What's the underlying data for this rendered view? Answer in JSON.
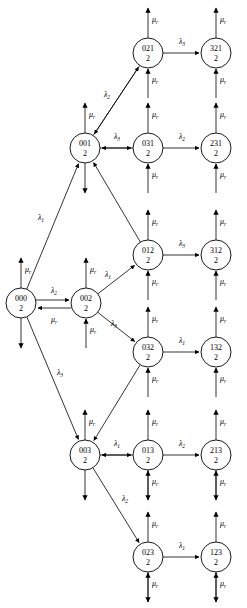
{
  "diagram": {
    "type": "markov-state-transition-graph",
    "node_radius": 15,
    "state_second_line": "2",
    "nodes": [
      {
        "id": "021",
        "label": "021",
        "sub": "2",
        "x": 148,
        "y": 53
      },
      {
        "id": "321",
        "label": "321",
        "sub": "2",
        "x": 216,
        "y": 53
      },
      {
        "id": "001",
        "label": "001",
        "sub": "2",
        "x": 85,
        "y": 148
      },
      {
        "id": "031",
        "label": "031",
        "sub": "2",
        "x": 148,
        "y": 148
      },
      {
        "id": "231",
        "label": "231",
        "sub": "2",
        "x": 216,
        "y": 148
      },
      {
        "id": "012",
        "label": "012",
        "sub": "2",
        "x": 148,
        "y": 255
      },
      {
        "id": "312",
        "label": "312",
        "sub": "2",
        "x": 216,
        "y": 255
      },
      {
        "id": "000",
        "label": "000",
        "sub": "2",
        "x": 21,
        "y": 303
      },
      {
        "id": "002",
        "label": "002",
        "sub": "2",
        "x": 86,
        "y": 303
      },
      {
        "id": "032",
        "label": "032",
        "sub": "2",
        "x": 148,
        "y": 352
      },
      {
        "id": "132",
        "label": "132",
        "sub": "2",
        "x": 216,
        "y": 352
      },
      {
        "id": "003",
        "label": "003",
        "sub": "2",
        "x": 85,
        "y": 455
      },
      {
        "id": "013",
        "label": "013",
        "sub": "2",
        "x": 148,
        "y": 455
      },
      {
        "id": "213",
        "label": "213",
        "sub": "2",
        "x": 216,
        "y": 455
      },
      {
        "id": "023",
        "label": "023",
        "sub": "2",
        "x": 148,
        "y": 557
      },
      {
        "id": "123",
        "label": "123",
        "sub": "2",
        "x": 216,
        "y": 557
      }
    ],
    "transition_rates": {
      "lambda1": {
        "base": "λ",
        "sub": "1"
      },
      "lambda2": {
        "base": "λ",
        "sub": "2"
      },
      "lambda3": {
        "base": "λ",
        "sub": "3"
      },
      "mu_r": {
        "base": "μ",
        "sub": "r"
      }
    },
    "horizontal_edges": [
      {
        "from": "021",
        "to": "321",
        "rate_base": "λ",
        "rate_sub": "3",
        "label_x": 182,
        "label_y": 44
      },
      {
        "from": "001",
        "to": "031",
        "rate_base": "λ",
        "rate_sub": "3",
        "label_x": 117,
        "label_y": 139
      },
      {
        "from": "031",
        "to": "231",
        "rate_base": "λ",
        "rate_sub": "2",
        "label_x": 182,
        "label_y": 139
      },
      {
        "from": "012",
        "to": "312",
        "rate_base": "λ",
        "rate_sub": "3",
        "label_x": 182,
        "label_y": 246
      },
      {
        "from": "032",
        "to": "132",
        "rate_base": "λ",
        "rate_sub": "1",
        "label_x": 182,
        "label_y": 343
      },
      {
        "from": "003",
        "to": "013",
        "rate_base": "λ",
        "rate_sub": "1",
        "label_x": 117,
        "label_y": 446
      },
      {
        "from": "013",
        "to": "213",
        "rate_base": "λ",
        "rate_sub": "2",
        "label_x": 182,
        "label_y": 446
      },
      {
        "from": "023",
        "to": "123",
        "rate_base": "λ",
        "rate_sub": "1",
        "label_x": 182,
        "label_y": 548
      }
    ],
    "diagonal_edges": [
      {
        "from": "001",
        "to": "021",
        "rate_base": "λ",
        "rate_sub": "2",
        "label_x": 107,
        "label_y": 97
      },
      {
        "from": "000",
        "to": "001",
        "rate_base": "λ",
        "rate_sub": "1",
        "label_x": 41,
        "label_y": 220
      },
      {
        "from": "000",
        "to": "003",
        "rate_base": "λ",
        "rate_sub": "3",
        "label_x": 60,
        "label_y": 375
      },
      {
        "from": "002",
        "to": "012",
        "rate_base": "λ",
        "rate_sub": "1",
        "label_x": 108,
        "label_y": 277
      },
      {
        "from": "002",
        "to": "032",
        "rate_base": "λ",
        "rate_sub": "3",
        "label_x": 114,
        "label_y": 326
      },
      {
        "from": "003",
        "to": "023",
        "rate_base": "λ",
        "rate_sub": "2",
        "label_x": 125,
        "label_y": 501
      }
    ],
    "bidirectional_pair": {
      "from": "000",
      "to": "002",
      "forward_base": "λ",
      "forward_sub": "2",
      "forward_label_x": 54,
      "forward_label_y": 293,
      "reverse_base": "μ",
      "reverse_sub": "r",
      "reverse_label_x": 54,
      "reverse_label_y": 322
    },
    "self_rate_label": {
      "base": "μ",
      "sub": "r"
    }
  }
}
